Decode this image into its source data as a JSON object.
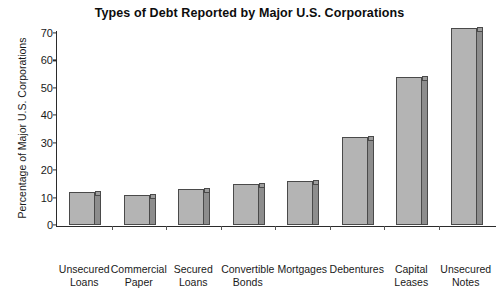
{
  "chart_data": {
    "type": "bar",
    "title": "Types of Debt Reported by Major U.S. Corporations",
    "xlabel": "",
    "ylabel": "Percentage of Major U.S. Corporations",
    "ylim": [
      0,
      70
    ],
    "yticks": [
      0,
      10,
      20,
      30,
      40,
      50,
      60,
      70
    ],
    "grid": false,
    "legend": null,
    "categories": [
      "Unsecured Loans",
      "Commercial Paper",
      "Secured Loans",
      "Convertible Bonds",
      "Mortgages",
      "Debentures",
      "Capital Leases",
      "Unsecured Notes"
    ],
    "category_lines": [
      [
        "Unsecured",
        "Loans"
      ],
      [
        "Commercial",
        "Paper"
      ],
      [
        "Secured",
        "Loans"
      ],
      [
        "Convertible",
        "Bonds"
      ],
      [
        "Mortgages",
        ""
      ],
      [
        "Debentures",
        ""
      ],
      [
        "Capital",
        "Leases"
      ],
      [
        "Unsecured",
        "Notes"
      ]
    ],
    "values": [
      12,
      11,
      13,
      15,
      16,
      32,
      54,
      72
    ],
    "colors": {
      "bar_face": "#b4b4b4",
      "bar_side": "#8d8d8d",
      "bar_outline": "#4a4a4a",
      "axis": "#2b2b2b",
      "text": "#1a1a1a",
      "background": "#ffffff"
    }
  }
}
